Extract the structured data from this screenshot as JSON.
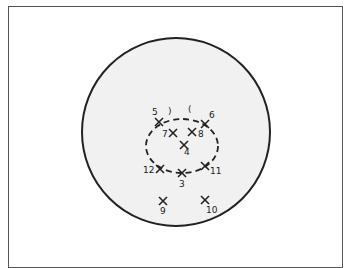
{
  "figure": {
    "frame_color": "#555555",
    "circle": {
      "cx": 176,
      "cy": 132,
      "r": 94,
      "stroke": "#222222",
      "fill": "#f1f1f1"
    },
    "ellipse": {
      "cx": 182,
      "cy": 146,
      "rx": 36,
      "ry": 27,
      "stroke": "#222222",
      "dash": "6 4"
    },
    "brackets": [
      {
        "glyph": ")",
        "x": 168,
        "y": 114
      },
      {
        "glyph": "(",
        "x": 188,
        "y": 112
      }
    ],
    "points": [
      {
        "id": "5",
        "label": "5",
        "x": 159,
        "y": 122,
        "lx": 152,
        "ly": 115
      },
      {
        "id": "6",
        "label": "6",
        "x": 205,
        "y": 124,
        "lx": 209,
        "ly": 118
      },
      {
        "id": "7",
        "label": "7",
        "x": 173,
        "y": 133,
        "lx": 162,
        "ly": 137
      },
      {
        "id": "8",
        "label": "8",
        "x": 192,
        "y": 132,
        "lx": 198,
        "ly": 137
      },
      {
        "id": "4",
        "label": "4",
        "x": 184,
        "y": 145,
        "lx": 184,
        "ly": 155
      },
      {
        "id": "12",
        "label": "12",
        "x": 160,
        "y": 169,
        "lx": 143,
        "ly": 173
      },
      {
        "id": "3",
        "label": "3",
        "x": 182,
        "y": 173,
        "lx": 179,
        "ly": 187
      },
      {
        "id": "11",
        "label": "11",
        "x": 205,
        "y": 166,
        "lx": 210,
        "ly": 174
      },
      {
        "id": "9",
        "label": "9",
        "x": 163,
        "y": 201,
        "lx": 160,
        "ly": 214
      },
      {
        "id": "10",
        "label": "10",
        "x": 205,
        "y": 200,
        "lx": 206,
        "ly": 213
      }
    ]
  }
}
